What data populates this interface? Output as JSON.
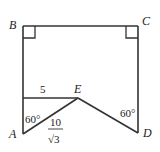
{
  "diagram": {
    "points": {
      "A": {
        "label": "A"
      },
      "B": {
        "label": "B"
      },
      "C": {
        "label": "C"
      },
      "D": {
        "label": "D"
      },
      "E": {
        "label": "E"
      }
    },
    "segments": [
      {
        "from": "B",
        "to": "C"
      },
      {
        "from": "B",
        "to": "A"
      },
      {
        "from": "C",
        "to": "D"
      },
      {
        "from": "A",
        "to": "E"
      },
      {
        "from": "E",
        "to": "D"
      },
      {
        "from": "E",
        "to": "left-side"
      }
    ],
    "right_angles": [
      "B",
      "C"
    ],
    "annotations": {
      "horizontal_length": "5",
      "angle_A": "60°",
      "angle_D": "60°",
      "AE_numerator": "10",
      "AE_denominator": "√3"
    }
  }
}
